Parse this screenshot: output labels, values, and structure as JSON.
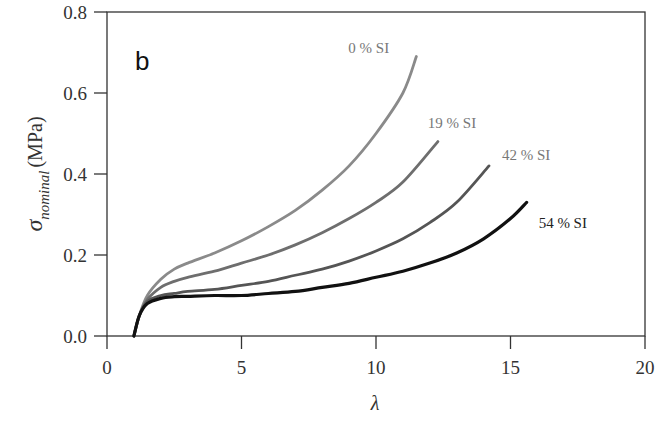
{
  "chart_data": {
    "type": "line",
    "title": "",
    "panel_label": "b",
    "xlabel": "λ",
    "ylabel_symbol": "σ",
    "ylabel_subscript": "nominal",
    "ylabel_unit": "(MPa)",
    "xlim": [
      0,
      20
    ],
    "ylim": [
      0,
      0.8
    ],
    "x_ticks": [
      0,
      5,
      10,
      15,
      20
    ],
    "x_tick_labels": [
      "0",
      "5",
      "10",
      "15",
      "20"
    ],
    "y_ticks": [
      0.0,
      0.2,
      0.4,
      0.6,
      0.8
    ],
    "y_tick_labels": [
      "0.0",
      "0.2",
      "0.4",
      "0.6",
      "0.8"
    ],
    "grid": false,
    "legend": "inline labels at curve ends",
    "series": [
      {
        "name": "0 % SI",
        "color": "#8a8a8a",
        "x": [
          1.0,
          1.2,
          1.5,
          2.0,
          2.5,
          3.0,
          4.0,
          5.0,
          6.0,
          7.0,
          8.0,
          9.0,
          10.0,
          11.0,
          11.5
        ],
        "y": [
          0.0,
          0.05,
          0.1,
          0.14,
          0.165,
          0.18,
          0.205,
          0.235,
          0.27,
          0.31,
          0.36,
          0.42,
          0.5,
          0.6,
          0.69
        ]
      },
      {
        "name": "19 % SI",
        "color": "#6e6e6e",
        "x": [
          1.0,
          1.2,
          1.5,
          2.0,
          2.5,
          3.0,
          4.0,
          5.0,
          6.0,
          7.0,
          8.0,
          9.0,
          10.0,
          11.0,
          12.3
        ],
        "y": [
          0.0,
          0.05,
          0.09,
          0.12,
          0.135,
          0.145,
          0.16,
          0.18,
          0.2,
          0.225,
          0.255,
          0.29,
          0.33,
          0.38,
          0.48
        ]
      },
      {
        "name": "42 % SI",
        "color": "#555555",
        "x": [
          1.0,
          1.2,
          1.5,
          2.0,
          2.5,
          3.0,
          4.0,
          5.0,
          6.0,
          7.0,
          8.0,
          9.0,
          10.0,
          11.0,
          12.0,
          13.0,
          14.2
        ],
        "y": [
          0.0,
          0.05,
          0.085,
          0.1,
          0.105,
          0.11,
          0.115,
          0.125,
          0.135,
          0.15,
          0.165,
          0.185,
          0.21,
          0.24,
          0.28,
          0.33,
          0.42
        ]
      },
      {
        "name": "54 % SI",
        "color": "#111111",
        "x": [
          1.0,
          1.2,
          1.5,
          2.0,
          2.5,
          3.0,
          4.0,
          5.0,
          6.0,
          7.0,
          8.0,
          9.0,
          10.0,
          11.0,
          12.0,
          13.0,
          14.0,
          15.0,
          15.6
        ],
        "y": [
          0.0,
          0.05,
          0.08,
          0.093,
          0.097,
          0.098,
          0.1,
          0.1,
          0.105,
          0.11,
          0.12,
          0.13,
          0.145,
          0.16,
          0.18,
          0.205,
          0.24,
          0.29,
          0.33
        ]
      }
    ]
  }
}
